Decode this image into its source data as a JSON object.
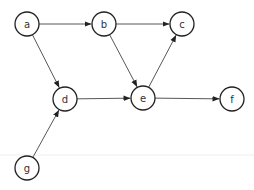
{
  "diagram": {
    "type": "directed-graph",
    "colors": {
      "node_stroke": "#222222",
      "node_fill": "#ffffff",
      "edge": "#444444",
      "label": "#333333",
      "divider": "#eeeeee"
    },
    "node_radius": 12,
    "nodes": [
      {
        "id": "a",
        "label": "a",
        "x": 27,
        "y": 24
      },
      {
        "id": "b",
        "label": "b",
        "x": 104,
        "y": 24
      },
      {
        "id": "c",
        "label": "c",
        "x": 182,
        "y": 24
      },
      {
        "id": "d",
        "label": "d",
        "x": 65,
        "y": 99
      },
      {
        "id": "e",
        "label": "e",
        "x": 143,
        "y": 98
      },
      {
        "id": "f",
        "label": "f",
        "x": 232,
        "y": 99
      },
      {
        "id": "g",
        "label": "g",
        "x": 27,
        "y": 168
      }
    ],
    "edges": [
      {
        "from": "a",
        "to": "b"
      },
      {
        "from": "b",
        "to": "c"
      },
      {
        "from": "a",
        "to": "d"
      },
      {
        "from": "b",
        "to": "e"
      },
      {
        "from": "e",
        "to": "c"
      },
      {
        "from": "d",
        "to": "e"
      },
      {
        "from": "e",
        "to": "f"
      },
      {
        "from": "g",
        "to": "d"
      }
    ],
    "divider_y": 155
  }
}
